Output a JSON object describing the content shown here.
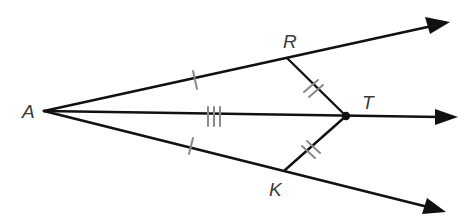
{
  "diagram": {
    "type": "geometry-angle-bisector",
    "points": {
      "A": {
        "label": "A",
        "x": 44,
        "y": 111
      },
      "R": {
        "label": "R",
        "x": 287,
        "y": 58
      },
      "T": {
        "label": "T",
        "x": 346,
        "y": 116
      },
      "K": {
        "label": "K",
        "x": 285,
        "y": 170
      }
    },
    "rays": [
      {
        "name": "ray-AR",
        "from": "A",
        "through": "R"
      },
      {
        "name": "ray-AT",
        "from": "A",
        "through": "T"
      },
      {
        "name": "ray-AK",
        "from": "A",
        "through": "K"
      }
    ],
    "segments": [
      {
        "name": "RT",
        "from": "R",
        "to": "T",
        "tick_marks": 2
      },
      {
        "name": "KT",
        "from": "K",
        "to": "T",
        "tick_marks": 2
      }
    ],
    "congruence_marks": [
      {
        "segment": "AR",
        "ticks": 1
      },
      {
        "segment": "AK",
        "ticks": 1
      },
      {
        "segment": "AT",
        "ticks": 3
      },
      {
        "segment": "RT",
        "ticks": 2
      },
      {
        "segment": "KT",
        "ticks": 2
      }
    ],
    "colors": {
      "line": "#111111",
      "tick": "#8a8a8a",
      "label": "#3a3a3a",
      "background": "#ffffff"
    }
  }
}
